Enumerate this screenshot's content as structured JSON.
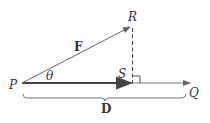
{
  "diagram": {
    "points": {
      "P": {
        "label": "P",
        "x": 22,
        "y": 83
      },
      "Q": {
        "label": "Q",
        "x": 190,
        "y": 83
      },
      "R": {
        "label": "R",
        "x": 132,
        "y": 26
      },
      "S": {
        "label": "S",
        "x": 132,
        "y": 83
      }
    },
    "vectors": {
      "force": {
        "label": "F",
        "from": "P",
        "to": "R"
      },
      "projection": {
        "from": "P",
        "to": "S"
      },
      "displacement_line": {
        "from": "P",
        "to": "Q"
      }
    },
    "angle": {
      "label": "θ",
      "at": "P"
    },
    "brace": {
      "label": "D",
      "from": "P",
      "to": "Q"
    },
    "colors": {
      "line": "#555555",
      "projection": "#444444",
      "text": "#333333"
    }
  }
}
